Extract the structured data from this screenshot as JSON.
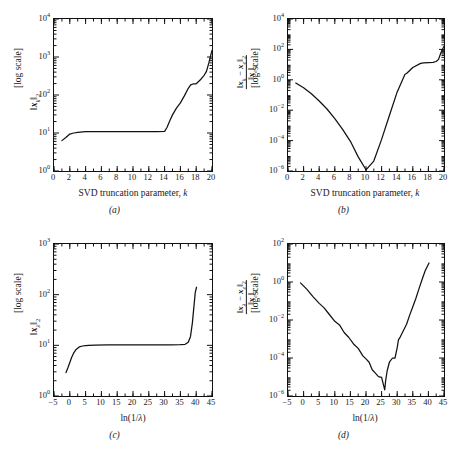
{
  "figure": {
    "background": "#ffffff",
    "line_color": "#111111",
    "panels": [
      "a",
      "b",
      "c",
      "d"
    ]
  },
  "panel_a": {
    "caption": "(a)",
    "xlabel_main": "SVD truncation parameter,",
    "xlabel_var": "k",
    "ylabel_norm": "x",
    "ylabel_sub": "k",
    "ylabel_p": "2",
    "ylabel_scale": "[log scale]",
    "xticks": [
      "0",
      "2",
      "4",
      "6",
      "8",
      "10",
      "12",
      "14",
      "16",
      "18",
      "20"
    ],
    "yticks": [
      "10",
      "10",
      "10",
      "10",
      "10"
    ],
    "yexps": [
      "0",
      "1",
      "2",
      "3",
      "4"
    ]
  },
  "panel_b": {
    "caption": "(b)",
    "xlabel_main": "SVD truncation parameter,",
    "xlabel_var": "k",
    "ylabel_num_x1": "x",
    "ylabel_num_sub1": "k",
    "ylabel_num_minus": "−",
    "ylabel_num_x2": "x",
    "ylabel_num_sub2": "e",
    "ylabel_num_p": "2",
    "ylabel_den_x": "x",
    "ylabel_den_sub": "e",
    "ylabel_den_p": "2",
    "ylabel_scale": "[log scale]",
    "xticks": [
      "0",
      "2",
      "4",
      "6",
      "8",
      "10",
      "12",
      "14",
      "16",
      "18",
      "20"
    ],
    "yticks": [
      "10",
      "10",
      "10",
      "10",
      "10",
      "10"
    ],
    "yexps": [
      "-6",
      "-4",
      "-2",
      "0",
      "2",
      "4"
    ]
  },
  "panel_c": {
    "caption": "(c)",
    "xlabel_main": "ln(1/",
    "xlabel_var": "λ",
    "xlabel_tail": ")",
    "ylabel_norm": "x",
    "ylabel_sub": "λ",
    "ylabel_p": "2",
    "ylabel_scale": "[log scale]",
    "xticks": [
      "−5",
      "0",
      "5",
      "10",
      "15",
      "20",
      "25",
      "30",
      "35",
      "40",
      "45"
    ],
    "yticks": [
      "10",
      "10",
      "10",
      "10"
    ],
    "yexps": [
      "0",
      "1",
      "2",
      "3"
    ]
  },
  "panel_d": {
    "caption": "(d)",
    "xlabel_main": "ln(1/",
    "xlabel_var": "λ",
    "xlabel_tail": ")",
    "ylabel_num_x1": "x",
    "ylabel_num_sub1": "λ",
    "ylabel_num_minus": "−",
    "ylabel_num_x2": "x",
    "ylabel_num_sub2": "e",
    "ylabel_num_p": "2",
    "ylabel_den_x": "x",
    "ylabel_den_sub": "e",
    "ylabel_den_p": "2",
    "ylabel_scale": "[log scale]",
    "xticks": [
      "−5",
      "0",
      "5",
      "10",
      "15",
      "20",
      "25",
      "30",
      "35",
      "40",
      "45"
    ],
    "yticks": [
      "10",
      "10",
      "10",
      "10",
      "10"
    ],
    "yexps": [
      "-6",
      "-4",
      "-2",
      "0",
      "2"
    ]
  },
  "chart_data": [
    {
      "type": "line",
      "panel": "a",
      "title": "",
      "xlabel": "SVD truncation parameter, k",
      "ylabel": "||x_k||_2 [log scale]",
      "xlim": [
        0,
        20
      ],
      "ylim": [
        1,
        10000
      ],
      "yscale": "log",
      "grid": false,
      "legend": "none",
      "x": [
        1,
        1.5,
        2,
        2.5,
        3,
        4,
        5,
        6,
        7,
        8,
        9,
        10,
        11,
        12,
        13,
        14,
        14.3,
        14.7,
        15,
        15.5,
        16,
        16.5,
        17,
        17.3,
        17.6,
        18,
        18.6,
        19,
        19.3,
        19.6,
        20
      ],
      "values": [
        6.3,
        7.6,
        9.4,
        10.0,
        10.4,
        10.8,
        10.9,
        10.9,
        10.9,
        10.9,
        10.9,
        10.9,
        10.9,
        10.9,
        10.9,
        11.0,
        14.0,
        22.0,
        30.0,
        45.0,
        62.0,
        95.0,
        150.0,
        185.0,
        195.0,
        197.0,
        260.0,
        330.0,
        420.0,
        700.0,
        1500.0
      ]
    },
    {
      "type": "line",
      "panel": "b",
      "title": "",
      "xlabel": "SVD truncation parameter, k",
      "ylabel": "||x_k - x_e||_2 / ||x_e||_2 [log scale]",
      "xlim": [
        0,
        20
      ],
      "ylim": [
        1e-06,
        10000
      ],
      "yscale": "log",
      "grid": false,
      "legend": "none",
      "x": [
        1,
        2,
        3,
        4,
        5,
        6,
        7,
        8,
        9,
        10,
        11,
        12,
        13,
        14,
        15,
        15.2,
        16,
        17,
        17.4,
        18,
        18.6,
        19,
        19.3,
        19.6,
        20
      ],
      "values": [
        0.62,
        0.3,
        0.12,
        0.04,
        0.012,
        0.0028,
        0.00055,
        9e-05,
        8.5e-06,
        1.2e-06,
        4.5e-06,
        0.00012,
        0.0045,
        0.16,
        2.3,
        2.6,
        6.5,
        12.0,
        13.0,
        13.5,
        14.0,
        16.0,
        22.0,
        60.0,
        160.0
      ]
    },
    {
      "type": "line",
      "panel": "c",
      "title": "",
      "xlabel": "ln(1/λ)",
      "ylabel": "||x_λ||_2 [log scale]",
      "xlim": [
        -5,
        45
      ],
      "ylim": [
        1,
        1000
      ],
      "yscale": "log",
      "grid": false,
      "legend": "none",
      "x": [
        -1.2,
        -0.6,
        0,
        0.6,
        1.2,
        2,
        3,
        4,
        5,
        6,
        8,
        12,
        16,
        20,
        24,
        28,
        32,
        35,
        36.5,
        37.5,
        38.2,
        38.8,
        39.3,
        39.7,
        40.1
      ],
      "values": [
        2.9,
        3.6,
        4.6,
        5.8,
        7.0,
        8.3,
        9.3,
        9.7,
        9.9,
        10.0,
        10.1,
        10.2,
        10.2,
        10.2,
        10.2,
        10.2,
        10.2,
        10.3,
        10.5,
        11.5,
        15.0,
        28.0,
        60.0,
        110.0,
        140.0
      ]
    },
    {
      "type": "line",
      "panel": "d",
      "title": "",
      "xlabel": "ln(1/λ)",
      "ylabel": "||x_λ - x_e||_2 / ||x_e||_2 [log scale]",
      "xlim": [
        -5,
        45
      ],
      "ylim": [
        1e-06,
        100
      ],
      "yscale": "log",
      "grid": false,
      "legend": "none",
      "x": [
        -1.0,
        1,
        3,
        5,
        6.5,
        8,
        10,
        11.5,
        13,
        14.5,
        16,
        17.5,
        19,
        20,
        21,
        22,
        23,
        24,
        25,
        25.5,
        26,
        26.3,
        26.8,
        27.5,
        28.5,
        29.3,
        30,
        30.4,
        31,
        32,
        33,
        34,
        35,
        36,
        37,
        38,
        39,
        40.2
      ],
      "values": [
        0.9,
        0.42,
        0.17,
        0.075,
        0.045,
        0.022,
        0.0085,
        0.0055,
        0.0022,
        0.0012,
        0.00055,
        0.00032,
        0.00013,
        9e-05,
        6e-05,
        2.4e-05,
        1.6e-05,
        1.05e-05,
        9.5e-06,
        4.5e-06,
        2.1e-06,
        6.5e-06,
        2.2e-05,
        6e-05,
        0.0001,
        0.0001,
        0.00035,
        0.0009,
        0.0013,
        0.0028,
        0.006,
        0.018,
        0.05,
        0.14,
        0.45,
        1.4,
        4.0,
        10.0
      ]
    }
  ]
}
